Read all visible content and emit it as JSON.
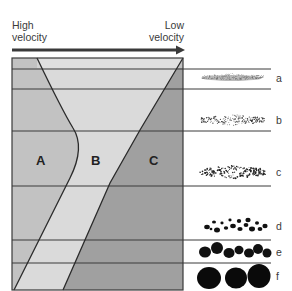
{
  "header": {
    "left_label_line1": "High",
    "left_label_line2": "velocity",
    "right_label_line1": "Low",
    "right_label_line2": "velocity"
  },
  "regions": [
    {
      "id": "A",
      "label": "A",
      "color": "#c2c2c2"
    },
    {
      "id": "B",
      "label": "B",
      "color": "#dadada"
    },
    {
      "id": "C",
      "label": "C",
      "color": "#a0a0a0"
    }
  ],
  "sediments": [
    {
      "label": "a",
      "type": "very fine particles"
    },
    {
      "label": "b",
      "type": "fine particles"
    },
    {
      "label": "c",
      "type": "small particles"
    },
    {
      "label": "d",
      "type": "granules"
    },
    {
      "label": "e",
      "type": "pebbles"
    },
    {
      "label": "f",
      "type": "cobbles"
    }
  ],
  "colors": {
    "line": "#3a3a3a",
    "arrow": "#3a3a3a",
    "particle": "#111111"
  }
}
